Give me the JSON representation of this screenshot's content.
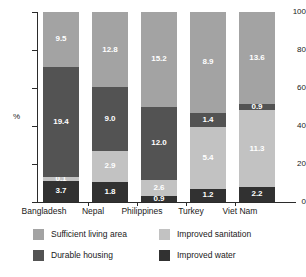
{
  "chart_data": {
    "type": "bar",
    "subtype": "stacked-bar-100-percent",
    "title": "",
    "xlabel": "",
    "ylabel": "%",
    "ylim": [
      0,
      100
    ],
    "yticks": [
      "0",
      "20",
      "40",
      "60",
      "80",
      "100"
    ],
    "grid": false,
    "legend_position": "bottom",
    "categories": [
      "Bangladesh",
      "Nepal",
      "Philippines",
      "Turkey",
      "Viet Nam"
    ],
    "stack_order_bottom_to_top": [
      "Improved water",
      "Improved sanitation",
      "Durable housing",
      "Sufficient living area"
    ],
    "series": [
      {
        "name": "Improved water",
        "color": "#313131",
        "values": [
          3.7,
          1.8,
          0.9,
          1.2,
          2.2
        ],
        "share_pct": [
          11.3,
          10.5,
          3.0,
          7.0,
          7.9
        ]
      },
      {
        "name": "Improved sanitation",
        "color": "#c2c2c2",
        "values": [
          0.1,
          2.9,
          2.6,
          5.4,
          11.3
        ],
        "share_pct": [
          2.1,
          16.5,
          8.5,
          32.5,
          40.5
        ]
      },
      {
        "name": "Durable housing",
        "color": "#535353",
        "values": [
          19.4,
          9.0,
          12.0,
          1.4,
          0.9
        ],
        "share_pct": [
          57.8,
          33.5,
          38.6,
          7.4,
          3.4
        ]
      },
      {
        "name": "Sufficient living area",
        "color": "#a3a3a3",
        "values": [
          9.5,
          12.8,
          15.2,
          8.9,
          13.6
        ],
        "share_pct": [
          28.8,
          39.5,
          49.9,
          53.1,
          48.2
        ]
      }
    ]
  },
  "axes": {
    "y_title": "%",
    "y_tick_labels": [
      "100",
      "80",
      "60",
      "40",
      "20",
      "0"
    ],
    "x_tick_labels": [
      "Bangladesh",
      "Nepal",
      "Philippines",
      "Turkey",
      "Viet Nam"
    ]
  },
  "legend": {
    "items": [
      {
        "label": "Sufficient living area",
        "swatch": "living"
      },
      {
        "label": "Improved sanitation",
        "swatch": "sanitation"
      },
      {
        "label": "Durable housing",
        "swatch": "housing"
      },
      {
        "label": "Improved water",
        "swatch": "water"
      }
    ]
  }
}
